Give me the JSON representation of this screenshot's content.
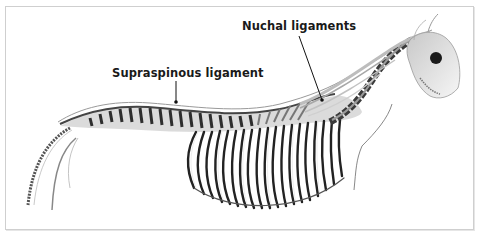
{
  "figure": {
    "labels": [
      {
        "id": "supraspinous",
        "text": "Supraspinous ligament"
      },
      {
        "id": "nuchal",
        "text": "Nuchal ligaments"
      }
    ]
  },
  "colors": {
    "frame_border": "#cfcfcf",
    "bone_dark": "#2b2b2b",
    "bone_mid": "#8a8a8a",
    "bone_light": "#d8d8d8",
    "label_text": "#1a1a1a",
    "background": "#ffffff"
  }
}
